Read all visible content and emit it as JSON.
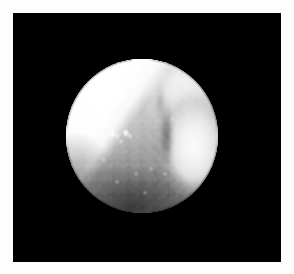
{
  "image": {
    "kind": "endoscopic-photograph",
    "modality_label": "endoscopy",
    "caption": "",
    "frame": {
      "outer_background_color": "#fdfdfd",
      "letterbox_color": "#000000",
      "letterbox_rect": {
        "x": 13,
        "y": 13,
        "width": 268,
        "height": 249
      }
    },
    "field_of_view": {
      "shape": "circle",
      "center_x": 142,
      "center_y": 136,
      "radius_x": 76,
      "radius_y": 77,
      "vignette": "true"
    },
    "colors": {
      "background": "#000000",
      "page": "#fdfdfd",
      "tissue_bright": "#ffffff",
      "tissue_mid": "#c8c8c8",
      "tissue_shadow": "#6a6a6a",
      "crevice_dark": "#4a4a4a",
      "specular": "#ffffff"
    },
    "regions": [
      {
        "name": "upper-left-glare",
        "description": "blown-out white specular wedge occupying the upper-left quadrant",
        "tone": "#ffffff"
      },
      {
        "name": "top-right-shoulder",
        "description": "bright rounded tissue shoulder along the top-right rim",
        "tone": "#f0f0f0"
      },
      {
        "name": "central-nodular-mass",
        "description": "textured granular mid-gray mucosal mass in the center",
        "tone": "#b4b4b4"
      },
      {
        "name": "right-lobe",
        "description": "bright rounded fold bulging from the right side",
        "tone": "#f2f2f2"
      },
      {
        "name": "vertical-crevice",
        "description": "dark vertical groove separating the central mass from the right lobe",
        "tone": "#585858"
      },
      {
        "name": "lower-recess",
        "description": "darker shadowed cavity across the lower field",
        "tone": "#4e4e4e"
      },
      {
        "name": "diagonal-shadow-edge",
        "description": "sharp diagonal boundary running from upper-right down to lower-left",
        "tone": "#9a9a9a"
      }
    ],
    "specular_highlights": [
      {
        "cx": 113,
        "cy": 134,
        "rx": 2.0,
        "ry": 3.4
      },
      {
        "cx": 118,
        "cy": 136,
        "rx": 1.4,
        "ry": 2.2
      },
      {
        "cx": 126,
        "cy": 133,
        "rx": 1.8,
        "ry": 3.0
      },
      {
        "cx": 130,
        "cy": 136,
        "rx": 1.3,
        "ry": 2.0
      },
      {
        "cx": 121,
        "cy": 141,
        "rx": 1.1,
        "ry": 1.5
      },
      {
        "cx": 136,
        "cy": 174,
        "rx": 1.4,
        "ry": 1.4
      },
      {
        "cx": 151,
        "cy": 169,
        "rx": 1.2,
        "ry": 1.2
      },
      {
        "cx": 165,
        "cy": 174,
        "rx": 1.3,
        "ry": 1.3
      },
      {
        "cx": 117,
        "cy": 182,
        "rx": 1.1,
        "ry": 1.1
      },
      {
        "cx": 145,
        "cy": 193,
        "rx": 1.0,
        "ry": 1.0
      },
      {
        "cx": 172,
        "cy": 118,
        "rx": 1.0,
        "ry": 1.0
      },
      {
        "cx": 104,
        "cy": 160,
        "rx": 1.0,
        "ry": 1.0
      }
    ]
  }
}
